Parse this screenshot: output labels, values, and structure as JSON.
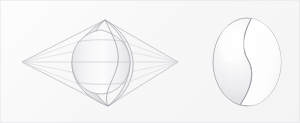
{
  "canvas": {
    "width": 300,
    "height": 123,
    "background_color": "#f7f7f8",
    "background_color_alt": "#fdfdfd",
    "border_color": "#e4e4e8"
  },
  "palette": {
    "wireframe_line": "#bfbfc6",
    "wireframe_line_faint": "#d2d2d8",
    "outline_stroke": "#9a9aa2",
    "surface_fill_light": "#fcfcfd",
    "surface_fill_mid": "#ededf0",
    "surface_fill_shadow": "#dcdce1",
    "highlight": "#ffffff",
    "cut_face_fill": "#ffffff"
  },
  "figures": [
    {
      "id": "wireframe-lens",
      "name": "wireframe-lens-figure",
      "label": "Wireframe lens solid with S-profile",
      "left_vertex": {
        "x": 22,
        "y": 62
      },
      "right_vertex": {
        "x": 178,
        "y": 62
      },
      "top_apex": {
        "x": 105,
        "y": 20
      },
      "bottom_apex": {
        "x": 108,
        "y": 106
      },
      "body": {
        "center_x": 101,
        "top_y": 20,
        "bottom_y": 106,
        "half_width": 29
      },
      "cross_sections": [
        {
          "id": "upper",
          "y": 42
        },
        {
          "id": "equator",
          "y": 62
        },
        {
          "id": "lower",
          "y": 82
        }
      ],
      "wire_count": 8
    },
    {
      "id": "shaded-sphere",
      "name": "shaded-sphere-figure",
      "label": "Shaded sphere with S-curve cut",
      "center": {
        "x": 247,
        "y": 62
      },
      "radius_x": 34,
      "radius_y": 44,
      "cut": {
        "id": "s-curve-cut",
        "label": "S-shaped crescent cut face",
        "orientation": "vertical-s"
      },
      "highlight": {
        "x": 232,
        "y": 44,
        "rx": 14,
        "ry": 20
      }
    }
  ]
}
